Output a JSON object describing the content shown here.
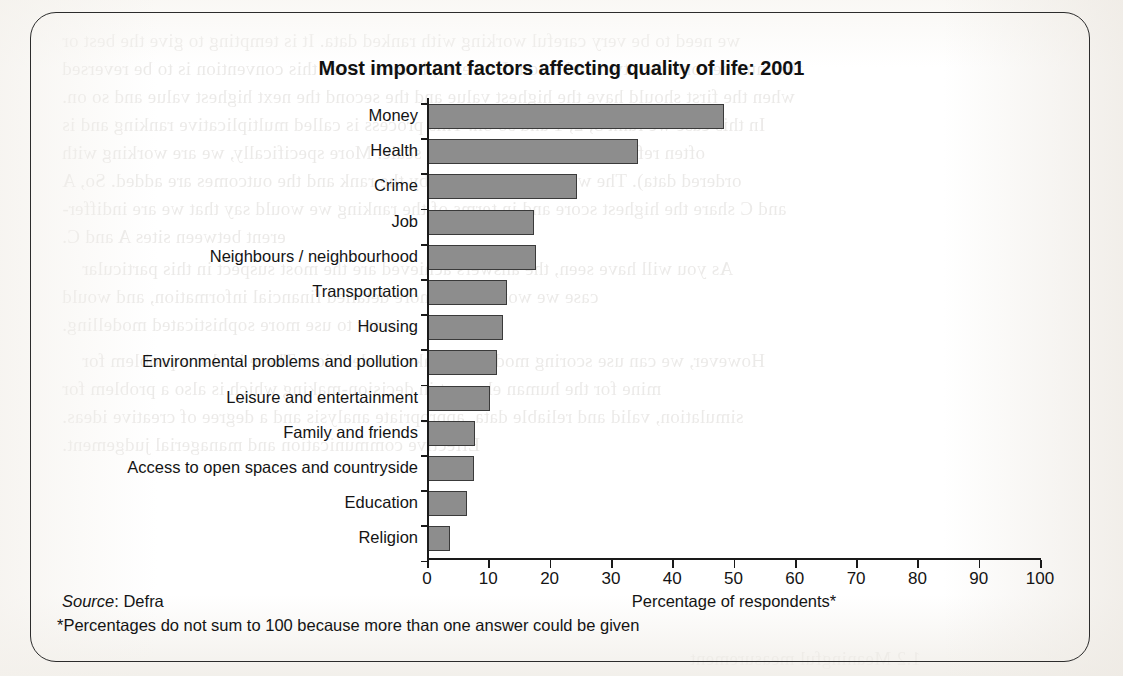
{
  "figure": {
    "title": "Most important factors affecting quality of life: 2001",
    "source_keyword": "Source",
    "source_text": ": Defra",
    "footnote": "*Percentages do not sum to 100 because more than one answer could be given",
    "frame_color": "#2c2c2c",
    "bar_fill_color": "#8d8d8d",
    "bar_edge_color": "#3a3a3a",
    "text_color": "#141414"
  },
  "chart_data": {
    "type": "bar",
    "orientation": "horizontal",
    "title": "Most important factors affecting quality of life: 2001",
    "xlabel": "Percentage of respondents*",
    "ylabel": "",
    "xlim": [
      0,
      100
    ],
    "xticks": [
      0,
      10,
      20,
      30,
      40,
      50,
      60,
      70,
      80,
      90,
      100
    ],
    "xtick_labels": [
      "0",
      "10",
      "20",
      "30",
      "40",
      "50",
      "60",
      "70",
      "80",
      "90",
      "100"
    ],
    "grid": false,
    "legend": false,
    "categories": [
      "Money",
      "Health",
      "Crime",
      "Job",
      "Neighbours / neighbourhood",
      "Transportation",
      "Housing",
      "Environmental problems and pollution",
      "Leisure and entertainment",
      "Family and friends",
      "Access to open spaces and countryside",
      "Education",
      "Religion"
    ],
    "values": [
      48.5,
      34.5,
      24.5,
      17.5,
      17.7,
      13.0,
      12.4,
      11.5,
      10.3,
      7.8,
      7.7,
      6.5,
      3.7
    ],
    "source": "Defra",
    "note": "*Percentages do not sum to 100 because more than one answer could be given"
  },
  "ghost_text": [
    {
      "x": 62,
      "y": 30,
      "t": "we need to be very careful working with ranked data. It is tempting to give the best or"
    },
    {
      "x": 62,
      "y": 58,
      "t": "first number one then two and so on. However, in most cases this convention is to be reversed"
    },
    {
      "x": 62,
      "y": 86,
      "t": "when the first should have the highest value and the second the next highest value and so on."
    },
    {
      "x": 62,
      "y": 114,
      "t": "In this case we rank 3, 2, 1 and so on. This process is called multiplicative ranking and is"
    },
    {
      "x": 62,
      "y": 142,
      "t": "often referred to as a multiplicative scale. More specifically, we are working with"
    },
    {
      "x": 62,
      "y": 170,
      "t": "ordered data). The weight is multiplied by the rank and the outcomes are added. So, A"
    },
    {
      "x": 62,
      "y": 198,
      "t": "and C share the highest score and in terms of the ranking we would say that we are indiffer-"
    },
    {
      "x": 62,
      "y": 226,
      "t": "erent between sites A and C."
    },
    {
      "x": 82,
      "y": 258,
      "t": "As you will have seen, the answers achieved are the most suspect in this particular"
    },
    {
      "x": 62,
      "y": 286,
      "t": "case we would want more detailed financial information, and would"
    },
    {
      "x": 62,
      "y": 314,
      "t": "want to use more sophisticated modelling."
    },
    {
      "x": 82,
      "y": 350,
      "t": "However, we can use scoring models to make the decision. There is also a problem for"
    },
    {
      "x": 62,
      "y": 378,
      "t": "mine for the human element in decision-making which is also a problem for"
    },
    {
      "x": 62,
      "y": 406,
      "t": "simulation, valid and reliable data, appropriate analysis and a degree of creative ideas."
    },
    {
      "x": 62,
      "y": 434,
      "t": "Effective communication and managerial judgement."
    },
    {
      "x": 690,
      "y": 648,
      "t": "1.2 Meaningful measurement"
    }
  ]
}
